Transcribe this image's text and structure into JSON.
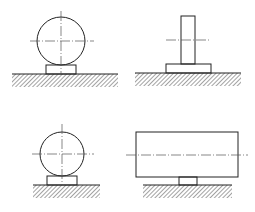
{
  "diagram": {
    "type": "mechanical-support-drawings",
    "colors": {
      "line": "#222222",
      "centerline": "#555555",
      "background": "#ffffff"
    },
    "figures": [
      {
        "id": "top-left",
        "name": "cylinder-on-block-support",
        "circle": {
          "cx": 61,
          "cy": 41,
          "r": 24
        },
        "base": {
          "x": 46,
          "y": 65,
          "w": 30,
          "h": 9
        },
        "centerlines": {
          "h": [
            30,
            94,
            41
          ],
          "v": [
            61,
            11,
            74
          ]
        },
        "ground": {
          "x1": 12,
          "x2": 118,
          "y": 74,
          "hatch_depth": 13
        }
      },
      {
        "id": "top-right",
        "name": "post-on-base-plate",
        "post": {
          "x": 181,
          "y": 16,
          "w": 14,
          "h": 48
        },
        "base": {
          "x": 166,
          "y": 64,
          "w": 45,
          "h": 9
        },
        "centerlines": {
          "h": [
            166,
            210,
            40
          ]
        },
        "ground": {
          "x1": 135,
          "x2": 241,
          "y": 73,
          "hatch_depth": 13
        }
      },
      {
        "id": "bottom-left",
        "name": "cylinder-on-block-support-small",
        "circle": {
          "cx": 62,
          "cy": 154,
          "r": 22
        },
        "base": {
          "x": 47,
          "y": 176,
          "w": 30,
          "h": 9
        },
        "centerlines": {
          "h": [
            32,
            94,
            154
          ],
          "v": [
            62,
            124,
            185
          ]
        },
        "ground": {
          "x1": 33,
          "x2": 100,
          "y": 185,
          "hatch_depth": 13
        }
      },
      {
        "id": "bottom-right",
        "name": "beam-on-narrow-support",
        "rect": {
          "x": 136,
          "y": 132,
          "w": 102,
          "h": 45
        },
        "stem": {
          "x": 179,
          "y": 177,
          "w": 18,
          "h": 8
        },
        "centerlines": {
          "h": [
            126,
            248,
            155
          ]
        },
        "ground": {
          "x1": 143,
          "x2": 232,
          "y": 185,
          "hatch_depth": 13
        }
      }
    ]
  }
}
